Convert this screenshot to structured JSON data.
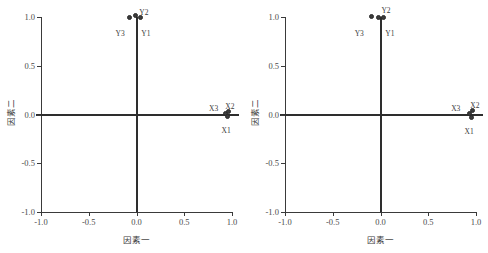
{
  "figure": {
    "panels": [
      {
        "id": "left",
        "name": "factor-loading-plot-left",
        "xlabel": "因素一",
        "ylabel": "因素二",
        "xticks": [
          "-1.0",
          "-0.5",
          "0.0",
          "0.5",
          "1.0"
        ],
        "yticks": [
          "1.0",
          "0.5",
          "0.0",
          "-0.5",
          "-1.0"
        ],
        "points": [
          {
            "label": "Y3",
            "x": -0.07,
            "y": 1.0,
            "lx": -0.22,
            "ly": 0.88
          },
          {
            "label": "Y2",
            "x": -0.01,
            "y": 1.02,
            "lx": 0.03,
            "ly": 1.09
          },
          {
            "label": "Y1",
            "x": 0.04,
            "y": 0.99,
            "lx": 0.05,
            "ly": 0.88
          },
          {
            "label": "X3",
            "x": 0.93,
            "y": 0.01,
            "lx": 0.76,
            "ly": 0.11
          },
          {
            "label": "X2",
            "x": 0.96,
            "y": 0.03,
            "lx": 0.93,
            "ly": 0.13
          },
          {
            "label": "X1",
            "x": 0.95,
            "y": -0.02,
            "lx": 0.89,
            "ly": -0.12
          }
        ]
      },
      {
        "id": "right",
        "name": "factor-loading-plot-right",
        "xlabel": "因素一",
        "ylabel": "因素二",
        "xticks": [
          "-1.0",
          "-0.5",
          "0.0",
          "0.5",
          "1.0"
        ],
        "yticks": [
          "1.0",
          "0.5",
          "0.0",
          "-0.5",
          "-1.0"
        ],
        "points": [
          {
            "label": "Y3",
            "x": -0.09,
            "y": 1.01,
            "lx": -0.27,
            "ly": 0.88
          },
          {
            "label": "Y2",
            "x": -0.02,
            "y": 1.0,
            "lx": 0.01,
            "ly": 1.11
          },
          {
            "label": "Y1",
            "x": 0.03,
            "y": 0.99,
            "lx": 0.05,
            "ly": 0.88
          },
          {
            "label": "X3",
            "x": 0.93,
            "y": 0.01,
            "lx": 0.74,
            "ly": 0.11
          },
          {
            "label": "X2",
            "x": 0.96,
            "y": 0.04,
            "lx": 0.94,
            "ly": 0.14
          },
          {
            "label": "X1",
            "x": 0.95,
            "y": -0.03,
            "lx": 0.88,
            "ly": -0.13
          }
        ]
      }
    ]
  },
  "chart_data": [
    {
      "type": "scatter",
      "title": "",
      "xlabel": "因素一",
      "ylabel": "因素二",
      "xlim": [
        -1.0,
        1.0
      ],
      "ylim": [
        -1.0,
        1.0
      ],
      "xticks": [
        -1.0,
        -0.5,
        0.0,
        0.5,
        1.0
      ],
      "yticks": [
        -1.0,
        -0.5,
        0.0,
        0.5,
        1.0
      ],
      "grid": false,
      "legend": "none",
      "zero_lines": true,
      "points": [
        {
          "label": "Y3",
          "x": -0.07,
          "y": 1.0
        },
        {
          "label": "Y2",
          "x": -0.01,
          "y": 1.02
        },
        {
          "label": "Y1",
          "x": 0.04,
          "y": 0.99
        },
        {
          "label": "X3",
          "x": 0.93,
          "y": 0.01
        },
        {
          "label": "X2",
          "x": 0.96,
          "y": 0.03
        },
        {
          "label": "X1",
          "x": 0.95,
          "y": -0.02
        }
      ]
    },
    {
      "type": "scatter",
      "title": "",
      "xlabel": "因素一",
      "ylabel": "因素二",
      "xlim": [
        -1.0,
        1.0
      ],
      "ylim": [
        -1.0,
        1.0
      ],
      "xticks": [
        -1.0,
        -0.5,
        0.0,
        0.5,
        1.0
      ],
      "yticks": [
        -1.0,
        -0.5,
        0.0,
        0.5,
        1.0
      ],
      "grid": false,
      "legend": "none",
      "zero_lines": true,
      "points": [
        {
          "label": "Y3",
          "x": -0.09,
          "y": 1.01
        },
        {
          "label": "Y2",
          "x": -0.02,
          "y": 1.0
        },
        {
          "label": "Y1",
          "x": 0.03,
          "y": 0.99
        },
        {
          "label": "X3",
          "x": 0.93,
          "y": 0.01
        },
        {
          "label": "X2",
          "x": 0.96,
          "y": 0.04
        },
        {
          "label": "X1",
          "x": 0.95,
          "y": -0.03
        }
      ]
    }
  ],
  "colors": {
    "marker": "#3b3b3b",
    "axis": "#3a3a3a",
    "zero_line": "#2e2e2e",
    "text": "#3a3a3a",
    "background": "#ffffff"
  }
}
